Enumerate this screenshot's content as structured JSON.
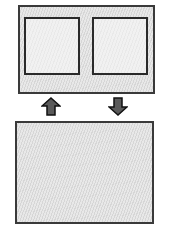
{
  "diagram": {
    "top_container": {
      "panels": [
        {
          "id": "left-panel"
        },
        {
          "id": "right-panel"
        }
      ]
    },
    "arrows": [
      {
        "direction": "up",
        "icon": "arrow-up-icon"
      },
      {
        "direction": "down",
        "icon": "arrow-down-icon"
      }
    ],
    "bottom_container": {},
    "colors": {
      "border": "#3a3a3a",
      "hatch_fill": "#e4e4e4",
      "panel_fill": "#efefef",
      "arrow_fill": "#5a5a5a",
      "arrow_stroke": "#111111",
      "background": "#ffffff"
    }
  }
}
